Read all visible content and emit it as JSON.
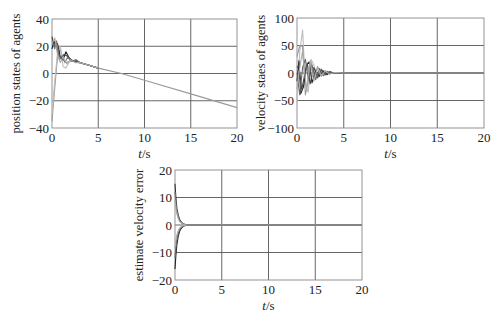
{
  "chart_data": [
    {
      "id": "position",
      "type": "line",
      "title": "",
      "xlabel": "t/s",
      "ylabel": "position states of agents",
      "xlim": [
        0,
        20
      ],
      "ylim": [
        -40,
        40
      ],
      "xticks": [
        0,
        5,
        10,
        15,
        20
      ],
      "yticks": [
        -40,
        -20,
        0,
        20,
        40
      ],
      "grid": true,
      "box": {
        "x": 52,
        "y": 19,
        "w": 185,
        "h": 109
      },
      "series": [
        {
          "name": "agent1",
          "color": "#9a9a9a",
          "x": [
            0,
            0.3,
            0.6,
            0.9,
            1.2,
            1.5,
            2,
            2.5,
            3,
            4,
            5,
            7.5,
            10,
            15,
            20
          ],
          "y": [
            -35,
            -10,
            12,
            18,
            10,
            8,
            9,
            9,
            8,
            6,
            4,
            0,
            -5,
            -15,
            -25
          ]
        },
        {
          "name": "agent2",
          "color": "#bdbdbd",
          "x": [
            0,
            0.3,
            0.6,
            0.9,
            1.2,
            1.5,
            2,
            2.5,
            3,
            4,
            5
          ],
          "y": [
            -30,
            -5,
            15,
            20,
            5,
            4,
            10,
            9,
            8,
            6,
            4
          ]
        },
        {
          "name": "agent3",
          "color": "#222222",
          "x": [
            0,
            0.2,
            0.4,
            0.6,
            0.9,
            1.2,
            1.5,
            1.8,
            2.2,
            2.6,
            3,
            3.5,
            4,
            5
          ],
          "y": [
            18,
            24,
            20,
            22,
            12,
            10,
            16,
            12,
            9,
            10,
            8,
            7,
            6,
            4
          ]
        },
        {
          "name": "agent4",
          "color": "#444444",
          "x": [
            0,
            0.2,
            0.4,
            0.7,
            1,
            1.3,
            1.6,
            2,
            2.5,
            3,
            4,
            5
          ],
          "y": [
            27,
            20,
            22,
            14,
            11,
            14,
            13,
            10,
            9,
            8,
            6,
            4
          ]
        },
        {
          "name": "agent5",
          "color": "#777777",
          "x": [
            0,
            0.3,
            0.5,
            0.8,
            1.1,
            1.4,
            1.7,
            2.1,
            2.6,
            3,
            4,
            5
          ],
          "y": [
            24,
            18,
            24,
            10,
            13,
            8,
            12,
            9,
            10,
            8,
            6,
            4
          ]
        },
        {
          "name": "agent6",
          "color": "#aaaaaa",
          "x": [
            0,
            0.3,
            0.6,
            0.9,
            1.2,
            1.6,
            2,
            2.5,
            3,
            4,
            5
          ],
          "y": [
            22,
            26,
            14,
            8,
            12,
            7,
            10,
            8,
            8,
            6,
            4
          ]
        }
      ]
    },
    {
      "id": "velocity",
      "type": "line",
      "title": "",
      "xlabel": "t/s",
      "ylabel": "velocity staes of agents",
      "xlim": [
        0,
        20
      ],
      "ylim": [
        -100,
        100
      ],
      "xticks": [
        0,
        5,
        10,
        15,
        20
      ],
      "yticks": [
        -100,
        -50,
        0,
        50,
        100
      ],
      "grid": true,
      "box": {
        "x": 297,
        "y": 18,
        "w": 187,
        "h": 110
      },
      "series": [
        {
          "name": "agent1",
          "color": "#bdbdbd",
          "x": [
            0,
            0.3,
            0.6,
            0.9,
            1.2,
            1.5,
            1.8,
            2.2,
            2.6,
            3,
            3.5,
            4,
            5,
            20
          ],
          "y": [
            -55,
            40,
            78,
            -20,
            -35,
            25,
            15,
            -10,
            8,
            -4,
            3,
            -1,
            0,
            0
          ]
        },
        {
          "name": "agent2",
          "color": "#999999",
          "x": [
            0,
            0.3,
            0.6,
            0.9,
            1.2,
            1.5,
            1.8,
            2.2,
            2.6,
            3,
            3.5,
            4,
            5,
            20
          ],
          "y": [
            30,
            50,
            48,
            -40,
            -15,
            20,
            -10,
            12,
            -6,
            4,
            -2,
            1,
            0,
            0
          ]
        },
        {
          "name": "agent3",
          "color": "#222222",
          "x": [
            0,
            0.2,
            0.4,
            0.7,
            1,
            1.3,
            1.6,
            2,
            2.4,
            2.8,
            3.2,
            3.6,
            4,
            5,
            20
          ],
          "y": [
            -15,
            22,
            -38,
            -25,
            15,
            20,
            -18,
            5,
            -6,
            4,
            -3,
            2,
            -1,
            0,
            0
          ]
        },
        {
          "name": "agent4",
          "color": "#444444",
          "x": [
            0,
            0.2,
            0.5,
            0.8,
            1.1,
            1.4,
            1.8,
            2.2,
            2.6,
            3,
            3.5,
            4,
            5,
            20
          ],
          "y": [
            10,
            15,
            -30,
            -5,
            18,
            -20,
            10,
            -8,
            6,
            -3,
            2,
            -1,
            0,
            0
          ]
        },
        {
          "name": "agent5",
          "color": "#666666",
          "x": [
            0,
            0.3,
            0.6,
            0.9,
            1.2,
            1.6,
            2,
            2.4,
            2.8,
            3.2,
            3.8,
            5,
            20
          ],
          "y": [
            0,
            -40,
            10,
            25,
            -10,
            15,
            -12,
            8,
            -5,
            3,
            -1,
            0,
            0
          ]
        },
        {
          "name": "agent6",
          "color": "#aaaaaa",
          "x": [
            0,
            0.3,
            0.6,
            1,
            1.4,
            1.8,
            2.2,
            2.6,
            3,
            3.5,
            4,
            5,
            20
          ],
          "y": [
            -30,
            10,
            40,
            -30,
            22,
            -15,
            10,
            -6,
            4,
            -2,
            1,
            0,
            0
          ]
        }
      ]
    },
    {
      "id": "estimate-error",
      "type": "line",
      "title": "",
      "xlabel": "t/s",
      "ylabel": "estimate velocity error",
      "xlim": [
        0,
        20
      ],
      "ylim": [
        -20,
        20
      ],
      "xticks": [
        0,
        5,
        10,
        15,
        20
      ],
      "yticks": [
        -20,
        -10,
        0,
        10,
        20
      ],
      "grid": true,
      "box": {
        "x": 175,
        "y": 170,
        "w": 187,
        "h": 110
      },
      "series": [
        {
          "name": "e1",
          "color": "#333333",
          "x": [
            0,
            0.1,
            0.2,
            0.35,
            0.5,
            0.7,
            0.9,
            1.2,
            1.5,
            20
          ],
          "y": [
            15,
            10,
            6,
            3.5,
            2,
            1,
            0.4,
            0.1,
            0,
            0
          ]
        },
        {
          "name": "e2",
          "color": "#777777",
          "x": [
            0,
            0.1,
            0.2,
            0.35,
            0.5,
            0.7,
            0.9,
            1.2,
            1.5,
            20
          ],
          "y": [
            12,
            8,
            5,
            3,
            1.6,
            0.8,
            0.3,
            0.1,
            0,
            0
          ]
        },
        {
          "name": "e3",
          "color": "#aaaaaa",
          "x": [
            0,
            0.1,
            0.2,
            0.35,
            0.5,
            0.7,
            0.9,
            1.2,
            1.5,
            20
          ],
          "y": [
            9,
            6,
            4,
            2.2,
            1.2,
            0.6,
            0.2,
            0.05,
            0,
            0
          ]
        },
        {
          "name": "e4",
          "color": "#222222",
          "x": [
            0,
            0.1,
            0.2,
            0.35,
            0.5,
            0.7,
            0.9,
            1.2,
            1.5,
            20
          ],
          "y": [
            -16,
            -11,
            -7,
            -4,
            -2.2,
            -1.1,
            -0.4,
            -0.1,
            0,
            0
          ]
        },
        {
          "name": "e5",
          "color": "#666666",
          "x": [
            0,
            0.1,
            0.2,
            0.35,
            0.5,
            0.7,
            0.9,
            1.2,
            1.5,
            20
          ],
          "y": [
            -12,
            -8,
            -5,
            -3,
            -1.6,
            -0.8,
            -0.3,
            -0.1,
            0,
            0
          ]
        },
        {
          "name": "e6",
          "color": "#aaaaaa",
          "x": [
            0,
            0.1,
            0.2,
            0.35,
            0.5,
            0.7,
            0.9,
            1.2,
            1.5,
            20
          ],
          "y": [
            -8,
            -5.5,
            -3.5,
            -2,
            -1.1,
            -0.5,
            -0.2,
            0,
            0,
            0
          ]
        }
      ]
    }
  ]
}
